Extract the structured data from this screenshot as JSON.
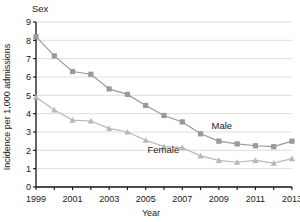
{
  "chart_data": {
    "type": "line",
    "title": "Sex",
    "xlabel": "Year",
    "ylabel": "Incidence per 1,000 admissions",
    "grid": true,
    "legend_position": "inline-annotation",
    "xlim": [
      1999,
      2013
    ],
    "ylim": [
      0,
      9
    ],
    "x": [
      1999,
      2000,
      2001,
      2002,
      2003,
      2004,
      2005,
      2006,
      2007,
      2008,
      2009,
      2010,
      2011,
      2012,
      2013
    ],
    "xtick_labels": [
      "1999",
      "2001",
      "2003",
      "2005",
      "2007",
      "2009",
      "2011",
      "2013"
    ],
    "xtick_values": [
      1999,
      2001,
      2003,
      2005,
      2007,
      2009,
      2011,
      2013
    ],
    "ytick_labels": [
      "0",
      "1",
      "2",
      "3",
      "4",
      "5",
      "6",
      "7",
      "8",
      "9"
    ],
    "ytick_values": [
      0,
      1,
      2,
      3,
      4,
      5,
      6,
      7,
      8,
      9
    ],
    "series": [
      {
        "name": "Male",
        "color": "#999999",
        "marker": "square",
        "label_x": 2008.6,
        "label_y": 3.15,
        "values": [
          8.2,
          7.15,
          6.3,
          6.15,
          5.35,
          5.05,
          4.45,
          3.9,
          3.55,
          2.9,
          2.5,
          2.35,
          2.25,
          2.2,
          2.5
        ]
      },
      {
        "name": "Female",
        "color": "#b8b8b8",
        "marker": "triangle",
        "label_x": 2005.1,
        "label_y": 1.85,
        "values": [
          4.9,
          4.2,
          3.65,
          3.6,
          3.2,
          3.0,
          2.55,
          2.2,
          2.15,
          1.7,
          1.45,
          1.35,
          1.45,
          1.3,
          1.55
        ]
      }
    ]
  },
  "axes": {
    "title_text": "Sex",
    "x_axis_title": "Year",
    "y_axis_title": "Incidence per 1,000 admissions"
  }
}
